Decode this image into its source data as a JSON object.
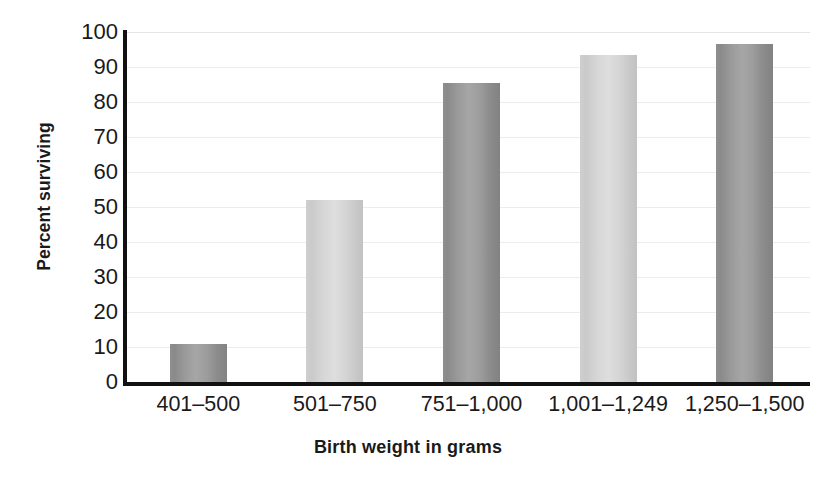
{
  "chart_data": {
    "type": "bar",
    "title": "",
    "xlabel": "Birth weight in grams",
    "ylabel": "Percent surviving",
    "categories": [
      "401–500",
      "501–750",
      "751–1,000",
      "1,001–1,249",
      "1,250–1,500"
    ],
    "values": [
      11,
      52,
      85.5,
      93.5,
      96.5
    ],
    "ylim": [
      0,
      100
    ],
    "yticks": [
      0,
      10,
      20,
      30,
      40,
      50,
      60,
      70,
      80,
      90,
      100
    ],
    "ytick_labels": [
      "0",
      "10",
      "20",
      "30",
      "40",
      "50",
      "60",
      "70",
      "80",
      "90",
      "100"
    ],
    "grid": true,
    "legend": "none",
    "bar_colors": [
      "#9a9a9a",
      "#d6d6d6",
      "#9a9a9a",
      "#d6d6d6",
      "#9a9a9a"
    ],
    "bar_shades": [
      "dark",
      "light",
      "dark",
      "light",
      "dark"
    ],
    "background_color": "#ffffff",
    "axis_color": "#111111",
    "gridline_color": "#ececec",
    "text_color": "#1a1a1a"
  }
}
